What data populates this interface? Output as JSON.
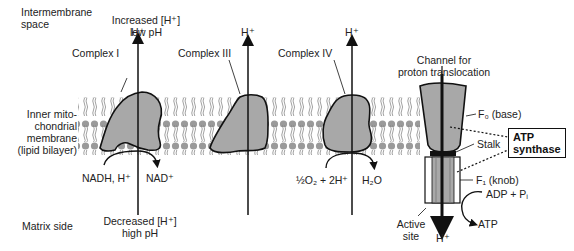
{
  "diagram": {
    "regions": {
      "intermembrane": {
        "line1": "Intermembrane",
        "line2": "space"
      },
      "intermembrane_condition": {
        "line1": "Increased [H⁺]",
        "line2": "low pH"
      },
      "membrane": {
        "line1": "Inner mito-",
        "line2": "chondrial",
        "line3": "membrane",
        "line4": "(lipid bilayer)"
      },
      "matrix": {
        "line1": "Matrix side"
      },
      "matrix_condition": {
        "line1": "Decreased [H⁺]",
        "line2": "high pH"
      }
    },
    "complexes": [
      {
        "label": "Complex I",
        "proton": "H⁺",
        "substrate": "NADH, H⁺",
        "product": "NAD⁺"
      },
      {
        "label": "Complex III",
        "proton": "H⁺"
      },
      {
        "label": "Complex IV",
        "proton": "H⁺",
        "substrate": "½O₂ + 2H⁺",
        "product": "H₂O"
      }
    ],
    "atp_synthase": {
      "channel_label": {
        "line1": "Channel for",
        "line2": "proton translocation"
      },
      "proton_top": "H⁺",
      "proton_bottom": "H⁺",
      "f0_label": "F₀ (base)",
      "stalk_label": "Stalk",
      "f1_label": "F₁ (knob)",
      "box_line1": "ATP",
      "box_line2": "synthase",
      "substrate": "ADP + Pᵢ",
      "product": "ATP",
      "active_site": {
        "line1": "Active",
        "line2": "site"
      }
    },
    "colors": {
      "protein_fill": "#a8a8a8",
      "outline": "#1a1a1a",
      "lipid": "#9a9a9a",
      "background": "#ffffff"
    }
  }
}
